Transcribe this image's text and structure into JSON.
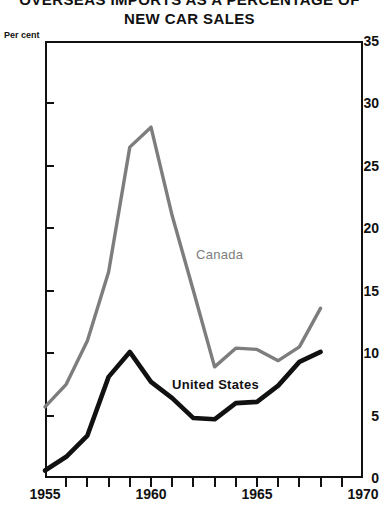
{
  "title": {
    "line1": "OVERSEAS IMPORTS AS A PERCENTAGE OF",
    "line2": "NEW CAR SALES"
  },
  "axis_unit_label": "Per cent",
  "colors": {
    "canada": "#7d7d7d",
    "united_states": "#111111",
    "axis": "#111111",
    "background": "#ffffff"
  },
  "chart_data": {
    "type": "line",
    "title": "OVERSEAS IMPORTS AS A PERCENTAGE OF NEW CAR SALES",
    "xlabel": "",
    "ylabel": "Per cent",
    "xlim": [
      1955,
      1970
    ],
    "ylim": [
      0,
      35
    ],
    "grid": false,
    "legend": "inline-annotations",
    "y_ticks": [
      0,
      5,
      10,
      15,
      20,
      25,
      30,
      35
    ],
    "y_tick_labels": [
      "0",
      "5",
      "10",
      "15",
      "20",
      "25",
      "30",
      "35"
    ],
    "x_ticks": [
      1955,
      1956,
      1957,
      1958,
      1959,
      1960,
      1961,
      1962,
      1963,
      1964,
      1965,
      1966,
      1967,
      1968,
      1969,
      1970
    ],
    "x_tick_labels_shown": [
      "1955",
      "1960",
      "1965",
      "1970"
    ],
    "x": [
      1955,
      1956,
      1957,
      1958,
      1959,
      1960,
      1961,
      1962,
      1963,
      1964,
      1965,
      1966,
      1967,
      1968
    ],
    "series": [
      {
        "name": "Canada",
        "color": "#7d7d7d",
        "values": [
          5.7,
          7.5,
          11.0,
          16.5,
          26.5,
          28.1,
          21.0,
          15.0,
          8.9,
          10.4,
          10.3,
          9.4,
          10.5,
          13.6
        ]
      },
      {
        "name": "United States",
        "color": "#111111",
        "values": [
          0.6,
          1.7,
          3.4,
          8.1,
          10.1,
          7.7,
          6.4,
          4.8,
          4.7,
          6.0,
          6.1,
          7.4,
          9.3,
          10.1
        ]
      }
    ],
    "annotations": [
      {
        "text": "Canada",
        "x": 1963.2,
        "y": 18.5
      },
      {
        "text": "United States",
        "x": 1960.6,
        "y": 8.2
      }
    ]
  }
}
